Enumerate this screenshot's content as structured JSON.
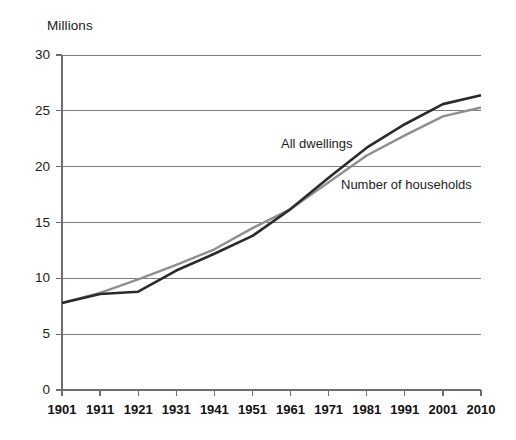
{
  "chart_data": {
    "type": "line",
    "title": "",
    "subtitle": "",
    "xlabel": "",
    "ylabel": "Millions",
    "unit_label": "Millions",
    "x": [
      1901,
      1911,
      1921,
      1931,
      1941,
      1951,
      1961,
      1971,
      1981,
      1991,
      2001,
      2010
    ],
    "categories": [
      "1901",
      "1911",
      "1921",
      "1931",
      "1941",
      "1951",
      "1961",
      "1971",
      "1981",
      "1991",
      "2001",
      "2010"
    ],
    "xlim": [
      1901,
      2010
    ],
    "ylim": [
      0,
      30
    ],
    "yticks": [
      0,
      5,
      10,
      15,
      20,
      25,
      30
    ],
    "ytick_labels": [
      "0",
      "5",
      "10",
      "15",
      "20",
      "25",
      "30"
    ],
    "grid": true,
    "grid_axis": "y",
    "legend": "inline-annotations",
    "legend_position": "inline",
    "series": [
      {
        "name": "All dwellings",
        "color": "#2b2b2b",
        "values": [
          7.8,
          8.6,
          8.8,
          10.7,
          12.2,
          13.8,
          16.2,
          19.0,
          21.7,
          23.8,
          25.6,
          26.4
        ]
      },
      {
        "name": "Number of households",
        "color": "#8f8f8f",
        "values": [
          7.8,
          8.7,
          9.9,
          11.2,
          12.6,
          14.5,
          16.2,
          18.6,
          21.0,
          22.8,
          24.5,
          25.3
        ]
      }
    ],
    "annotations": [
      {
        "text": "All dwellings",
        "x_px": 281,
        "y_px": 148
      },
      {
        "text": "Number of households",
        "x_px": 341,
        "y_px": 189
      }
    ]
  },
  "colors": {
    "background": "#ffffff",
    "grid": "#7d7d7d",
    "axis": "#6e6e6e",
    "text": "#1b1b1b",
    "series_dark": "#2b2b2b",
    "series_gray": "#8f8f8f"
  },
  "geometry": {
    "plot_left": 62,
    "plot_right": 481,
    "plot_top": 55,
    "plot_bottom": 390
  }
}
